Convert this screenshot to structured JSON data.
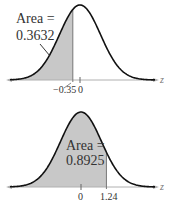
{
  "chart_data": [
    {
      "type": "area",
      "title": "",
      "xlabel": "z",
      "ylabel": "",
      "distribution": "standard normal",
      "shaded_region": "left of z = -0.35",
      "shade_from": null,
      "shade_to": -0.35,
      "annotation": {
        "line1": "Area =",
        "line2": "0.3632"
      },
      "area": 0.3632,
      "tick_labels": [
        "−0.35",
        "0"
      ],
      "tick_values": [
        -0.35,
        0
      ],
      "xlim": [
        -3.5,
        3.7
      ],
      "grid": false,
      "legend": null
    },
    {
      "type": "area",
      "title": "",
      "xlabel": "z",
      "ylabel": "",
      "distribution": "standard normal",
      "shaded_region": "left of z = 1.24",
      "shade_from": null,
      "shade_to": 1.24,
      "annotation": {
        "line1": "Area =",
        "line2": "0.8925"
      },
      "area": 0.8925,
      "tick_labels": [
        "0",
        "1.24"
      ],
      "tick_values": [
        0,
        1.24
      ],
      "xlim": [
        -3.5,
        3.7
      ],
      "grid": false,
      "legend": null
    }
  ],
  "colors": {
    "curve": "#111111",
    "shade": "#c8c8c8",
    "axis": "#b0b0b0",
    "text": "#333333"
  }
}
